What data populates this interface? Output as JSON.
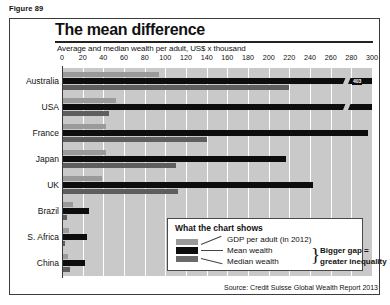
{
  "figure_label": "Figure 89",
  "title": "The mean difference",
  "subtitle": "Average and median wealth per adult, US$ x thousand",
  "source": "Source: Credit Suisse Global Wealth Report 2013",
  "legend": {
    "heading": "What the chart shows",
    "gdp_label": "GDP per adult (in 2012)",
    "mean_label": "Mean wealth",
    "median_label": "Median wealth",
    "annotation_line1": "Bigger gap =",
    "annotation_line2": "greater inequality"
  },
  "colors": {
    "gdp": "#9a9a9a",
    "mean": "#0d0d0d",
    "median": "#5e5e5e",
    "plot_background": "#c9c9c9",
    "gridline": "#ffffff",
    "frame": "#3c3c3c"
  },
  "chart_data": {
    "type": "bar",
    "orientation": "horizontal",
    "title": "The mean difference",
    "xlabel": "Average and median wealth per adult, US$ x thousand",
    "ylabel": "",
    "xlim": [
      0,
      300
    ],
    "xticks": [
      0,
      20,
      40,
      60,
      80,
      100,
      120,
      140,
      160,
      180,
      200,
      220,
      240,
      260,
      280,
      300
    ],
    "grid": true,
    "legend_position": "inside-bottom-right",
    "categories": [
      "Australia",
      "USA",
      "France",
      "Japan",
      "UK",
      "Brazil",
      "S. Africa",
      "China"
    ],
    "series": [
      {
        "name": "GDP per adult (in 2012)",
        "color": "#9a9a9a",
        "values": [
          94,
          52,
          43,
          43,
          39,
          11,
          7,
          6
        ]
      },
      {
        "name": "Mean wealth",
        "color": "#0d0d0d",
        "values": [
          403,
          301,
          296,
          217,
          243,
          26,
          24,
          22
        ]
      },
      {
        "name": "Median wealth",
        "color": "#5e5e5e",
        "values": [
          220,
          45,
          140,
          110,
          112,
          5,
          3,
          8
        ]
      }
    ],
    "annotations": [
      {
        "category": "Australia",
        "series": "Mean wealth",
        "text": "403",
        "note": "bar exceeds axis maximum; drawn with axis-break marker"
      }
    ]
  }
}
